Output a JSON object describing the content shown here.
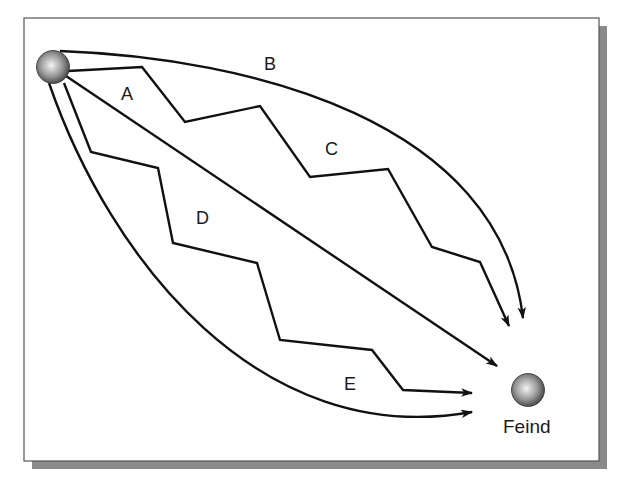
{
  "diagram": {
    "colors": {
      "background": "#ffffff",
      "frame_border": "#555555",
      "frame_shadow": "#8a8a8a",
      "line": "#111111",
      "sphere_light": "#f2f2f2",
      "sphere_dark": "#4a4a4a"
    },
    "source_node": {
      "label": "",
      "icon": "sphere-icon"
    },
    "target_node": {
      "label": "Feind",
      "icon": "sphere-icon"
    },
    "paths": [
      {
        "id": "A",
        "label": "A",
        "style": "straight"
      },
      {
        "id": "B",
        "label": "B",
        "style": "curved"
      },
      {
        "id": "C",
        "label": "C",
        "style": "zigzag"
      },
      {
        "id": "D",
        "label": "D",
        "style": "zigzag"
      },
      {
        "id": "E",
        "label": "E",
        "style": "curved"
      }
    ]
  }
}
